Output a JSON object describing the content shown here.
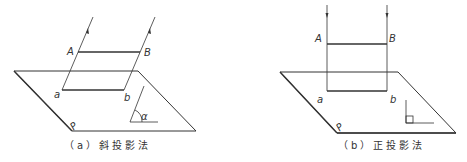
{
  "figures": [
    {
      "id": "a",
      "caption": "（a）斜投影法",
      "labels": {
        "A": "A",
        "B": "B",
        "a": "a",
        "b": "b",
        "plane": "P",
        "angle": "α"
      }
    },
    {
      "id": "b",
      "caption": "（b）正投影法",
      "labels": {
        "A": "A",
        "B": "B",
        "a": "a",
        "b": "b",
        "plane": "P"
      }
    }
  ],
  "colors": {
    "line": "#333333",
    "background": "#ffffff"
  }
}
